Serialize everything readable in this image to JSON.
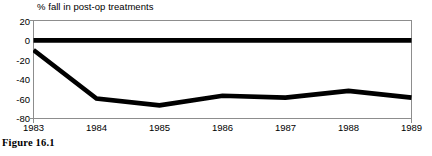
{
  "chart_data": {
    "type": "line",
    "title": "% fall in post-op treatments",
    "xlabel": "",
    "ylabel": "",
    "categories": [
      "1983",
      "1984",
      "1985",
      "1986",
      "1987",
      "1988",
      "1989"
    ],
    "series": [
      {
        "name": "baseline",
        "values": [
          0,
          0,
          0,
          0,
          0,
          0,
          0
        ],
        "color": "#000000"
      },
      {
        "name": "% fall in post-op treatments",
        "values": [
          -10,
          -60,
          -67,
          -57,
          -59,
          -52,
          -59
        ],
        "color": "#000000"
      }
    ],
    "ylim": [
      -80,
      20
    ],
    "yticks": [
      20,
      0,
      -20,
      -40,
      -60,
      -80
    ],
    "ytick_labels": [
      "20",
      "0",
      "-20",
      "-40",
      "-60",
      "-80"
    ],
    "grid": false,
    "legend": "none"
  },
  "caption": {
    "text": "Figure 16.1"
  }
}
